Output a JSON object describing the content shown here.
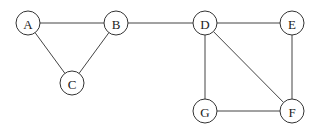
{
  "graph": {
    "nodes": [
      {
        "id": "A",
        "label": "A",
        "x": 28,
        "y": 23
      },
      {
        "id": "B",
        "label": "B",
        "x": 116,
        "y": 23
      },
      {
        "id": "C",
        "label": "C",
        "x": 72,
        "y": 83
      },
      {
        "id": "D",
        "label": "D",
        "x": 205,
        "y": 23
      },
      {
        "id": "E",
        "label": "E",
        "x": 292,
        "y": 23
      },
      {
        "id": "F",
        "label": "F",
        "x": 292,
        "y": 111
      },
      {
        "id": "G",
        "label": "G",
        "x": 205,
        "y": 111
      }
    ],
    "edges": [
      [
        "A",
        "B"
      ],
      [
        "A",
        "C"
      ],
      [
        "B",
        "C"
      ],
      [
        "B",
        "D"
      ],
      [
        "D",
        "E"
      ],
      [
        "D",
        "G"
      ],
      [
        "D",
        "F"
      ],
      [
        "E",
        "F"
      ],
      [
        "G",
        "F"
      ]
    ],
    "node_radius": 12
  }
}
